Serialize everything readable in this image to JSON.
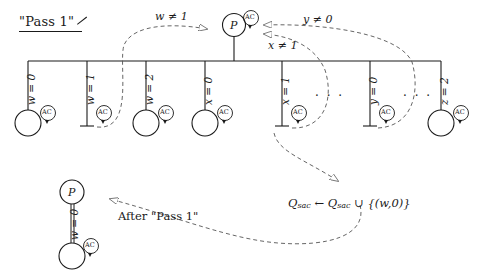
{
  "figure": {
    "title": "\"Pass 1\"",
    "after_label": "After \"Pass 1\"",
    "root_node_label": "P",
    "ac_label": "AC",
    "ellipsis": "· · ·",
    "bottom_symbol": "⊥"
  },
  "top_tree": {
    "branches": [
      {
        "label": "w = 0",
        "terminal": "circle"
      },
      {
        "label": "w = 1",
        "terminal": "bottom"
      },
      {
        "label": "w = 2",
        "terminal": "circle"
      },
      {
        "label": "x = 0",
        "terminal": "circle"
      },
      {
        "label": "x = 1",
        "terminal": "bottom"
      },
      {
        "label": "y = 0",
        "terminal": "bottom"
      },
      {
        "label": "z = 2",
        "terminal": "circle"
      }
    ],
    "ellipses": [
      "· · ·",
      "· · ·"
    ]
  },
  "annotations": {
    "cond_w": "w ≠ 1",
    "cond_y": "y ≠ 0",
    "cond_x": "x ≠ 1",
    "assignment_prefix": "Q",
    "assignment_sub": "sac",
    "assignment": "Q_sac ← Q_sac ∪ {(w,0)}",
    "assignment_arrow": "←",
    "assignment_union": "∪",
    "assignment_pair": "{(w,0)}"
  },
  "bottom_tree": {
    "node_label": "P",
    "edge_label": "w = 0",
    "ac_label": "AC"
  },
  "colors": {
    "ink": "#1a1a1a",
    "dash": "#555555",
    "background": "#ffffff"
  }
}
